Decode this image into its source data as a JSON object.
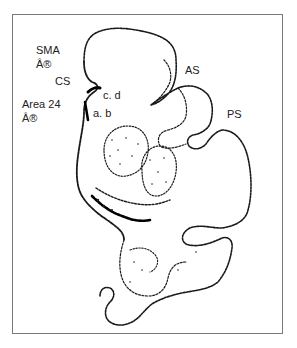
{
  "figure": {
    "labels": {
      "sma": "SMA",
      "sma_mark": "Â®",
      "cs": "CS",
      "cd": "c. d",
      "area24": "Area 24",
      "area24_mark": "Â®",
      "ab": "a. b",
      "as": "AS",
      "ps": "PS"
    },
    "colors": {
      "ink": "#111111",
      "frame": "#7a7a7a",
      "background": "#ffffff"
    }
  }
}
